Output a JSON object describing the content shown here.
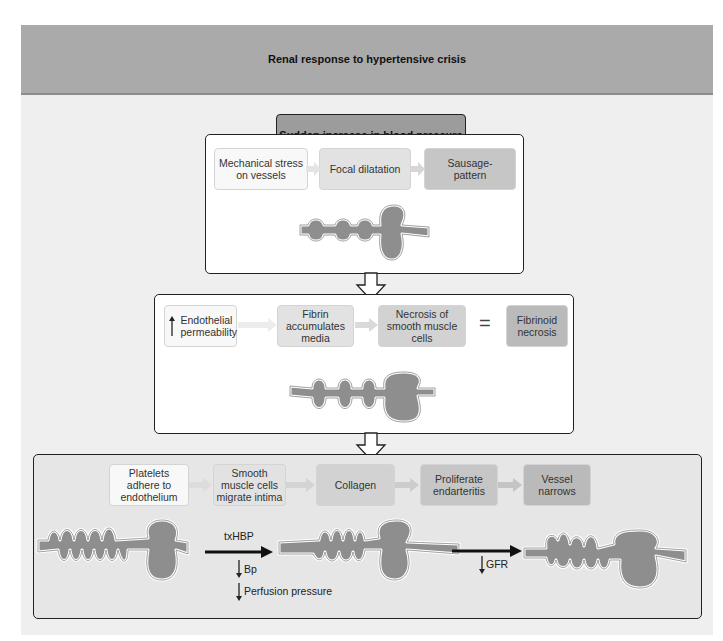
{
  "title": "Renal response to hypertensive crisis",
  "start": "Sudden increase in blood pressure",
  "stage1": {
    "steps": [
      "Mechanical stress on vessels",
      "Focal dilatation",
      "Sausage-pattern"
    ],
    "vessel_icon": "sausage-vessel-icon"
  },
  "stage2": {
    "steps": [
      "Endothelial permeability",
      "Fibrin accumulates media",
      "Necrosis of smooth muscle cells"
    ],
    "equals": "=",
    "result": "Fibrinoid necrosis",
    "first_step_indicator": "up-arrow-icon",
    "vessel_icon": "beaded-vessel-icon"
  },
  "stage3": {
    "steps": [
      "Platelets adhere to endothelium",
      "Smooth muscle cells migrate intima",
      "Collagen",
      "Proliferate endarteritis",
      "Vessel narrows"
    ],
    "arrow1_label": "txHBP",
    "arrow1_effects": [
      "Bp",
      "Perfusion pressure"
    ],
    "arrow2_effects": [
      "GFR"
    ],
    "effect_indicator": "down-arrow-icon"
  },
  "colors": {
    "header": "#aaaaaa",
    "start_box": "#9c9c9c",
    "vessel_fill": "#8e8e8e",
    "panel_grey": "#e6e6e6"
  }
}
